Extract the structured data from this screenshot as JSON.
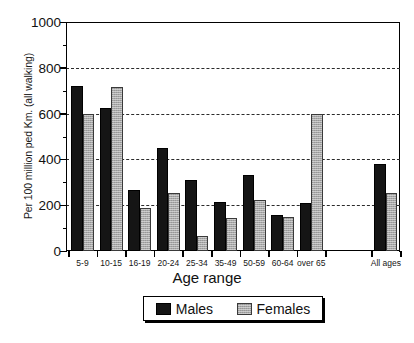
{
  "chart_data": {
    "type": "bar",
    "title": "",
    "xlabel": "Age range",
    "ylabel": "Per 100 million ped Km. (all walking)",
    "ylim": [
      0,
      1000
    ],
    "yticks": [
      0,
      200,
      400,
      600,
      800,
      1000
    ],
    "ytick_labels": [
      "0",
      "200",
      "400",
      "600",
      "800",
      "1000"
    ],
    "minor_tick_step": 100,
    "grid": "horizontal-dashed",
    "legend_position": "below-plot",
    "categories": [
      "5-9",
      "10-15",
      "16-19",
      "20-24",
      "25-34",
      "35-49",
      "50-59",
      "60-64",
      "over 65",
      "All ages"
    ],
    "series": [
      {
        "name": "Males",
        "color": "#151515",
        "values": [
          720,
          625,
          268,
          450,
          312,
          212,
          333,
          158,
          208,
          380
        ]
      },
      {
        "name": "Females",
        "color": "#a8a8a8",
        "values": [
          598,
          715,
          188,
          253,
          65,
          145,
          222,
          150,
          598,
          253
        ]
      }
    ]
  },
  "legend": {
    "items": [
      {
        "label": "Males",
        "swatch": "black-solid-swatch"
      },
      {
        "label": "Females",
        "swatch": "gray-hatched-swatch"
      }
    ]
  }
}
